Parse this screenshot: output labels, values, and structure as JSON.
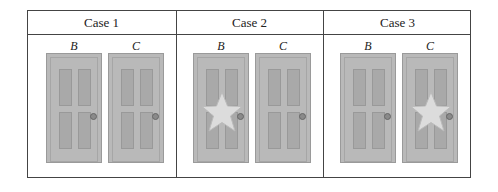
{
  "table": {
    "cases": [
      {
        "title": "Case 1",
        "doors": [
          {
            "label": "B",
            "star": false
          },
          {
            "label": "C",
            "star": false
          }
        ]
      },
      {
        "title": "Case 2",
        "doors": [
          {
            "label": "B",
            "star": true
          },
          {
            "label": "C",
            "star": false
          }
        ]
      },
      {
        "title": "Case 3",
        "doors": [
          {
            "label": "B",
            "star": false
          },
          {
            "label": "C",
            "star": true
          }
        ]
      }
    ]
  },
  "colors": {
    "door": "#b9b9b9",
    "panel": "#a9a9a9",
    "star": "#dcdcdc",
    "border": "#444444"
  }
}
